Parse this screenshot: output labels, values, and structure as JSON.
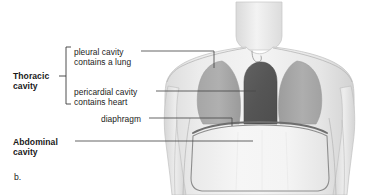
{
  "figure": {
    "panel_letter": "b.",
    "title_alt": "Thoracic and abdominal body cavities"
  },
  "labels": {
    "pleural_line1": "pleural cavity",
    "pleural_line2": "contains a lung",
    "pericardial_line1": "pericardial cavity",
    "pericardial_line2": "contains heart",
    "diaphragm": "diaphragm",
    "thoracic_line1": "Thoracic",
    "thoracic_line2": "cavity",
    "abdominal_line1": "Abdominal",
    "abdominal_line2": "cavity"
  },
  "anatomy": {
    "lung_left_name": "left lung",
    "lung_right_name": "right lung",
    "heart_name": "heart",
    "diaphragm_name": "diaphragm",
    "abdominal_cavity_name": "abdominal cavity",
    "neck_name": "neck",
    "arm_left_name": "left arm",
    "arm_right_name": "right arm",
    "sternal_notch_name": "suprasternal notch"
  },
  "colors": {
    "body_fill": "#e9e9e9",
    "body_edge": "#c9c9c9",
    "lung_fill": "#a9a9a9",
    "heart_fill": "#585858",
    "abdomen_fill": "#f2f2f2",
    "diaphragm_stroke": "#6e6e6e",
    "leader_line": "#4a4a4a",
    "text": "#1a1a1a",
    "background": "#ffffff"
  }
}
